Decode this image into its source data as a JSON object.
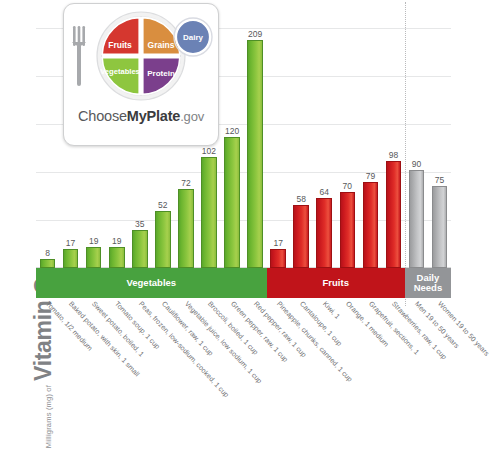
{
  "axis": {
    "y_title_small": "Milligrams (mg) of",
    "y_title_large": "Vitamin C",
    "y_min": 0,
    "y_max": 220,
    "gridlines": [
      0,
      44,
      88,
      132,
      176,
      220
    ]
  },
  "logo": {
    "name": "myplate-logo",
    "wordmark_1": "Choose",
    "wordmark_2": "MyPlate",
    "wordmark_3": ".gov",
    "segments": [
      {
        "label": "Fruits",
        "color": "#d5372f"
      },
      {
        "label": "Grains",
        "color": "#d98e3f"
      },
      {
        "label": "Vegetables",
        "color": "#8ec63f"
      },
      {
        "label": "Protein",
        "color": "#7b3f8c"
      },
      {
        "label": "Dairy",
        "color": "#6b82b5"
      }
    ]
  },
  "bands": [
    {
      "label": "Vegetables",
      "color": "#48a23f",
      "count": 10
    },
    {
      "label": "Fruits",
      "color": "#c0141a",
      "count": 6
    },
    {
      "label": "Daily Needs",
      "color": "#939598",
      "count": 2
    }
  ],
  "chart_data": {
    "type": "bar",
    "title": "Vitamin C",
    "xlabel": "",
    "ylabel": "Milligrams (mg) of Vitamin C",
    "ylim": [
      0,
      220
    ],
    "grid": true,
    "legend": "none",
    "categories": [
      "Tomato, 1/2 medium",
      "Baked potato, with skin, 1 small",
      "Sweet potato, boiled, 1",
      "Tomato soup, 1 cup",
      "Peas, frozen, low-sodium, cooked, 1 cup",
      "Cauliflower, raw, 1 cup",
      "Vegetable juice, low sodium, 1 cup",
      "Broccoli, boiled, 1 cup",
      "Green pepper, raw, 1 cup",
      "Red pepper, raw, 1 cup",
      "Pineapple, chunks, canned, 1 cup",
      "Cantaloupe, 1 cup",
      "Kiwi, 1",
      "Orange, 1 medium",
      "Grapefruit, sections, 1",
      "Strawberries, raw, 1 cup",
      "Men 19 to 50 years",
      "Women 19 to 50 years"
    ],
    "values": [
      8,
      17,
      19,
      19,
      35,
      52,
      72,
      102,
      120,
      209,
      17,
      58,
      64,
      70,
      79,
      98,
      90,
      75
    ],
    "groups": [
      "Vegetables",
      "Vegetables",
      "Vegetables",
      "Vegetables",
      "Vegetables",
      "Vegetables",
      "Vegetables",
      "Vegetables",
      "Vegetables",
      "Vegetables",
      "Fruits",
      "Fruits",
      "Fruits",
      "Fruits",
      "Fruits",
      "Fruits",
      "Daily Needs",
      "Daily Needs"
    ],
    "colors": {
      "Vegetables": "#8cc63f",
      "Fruits": "#d8232a",
      "Daily Needs": "#bcbdbf"
    }
  }
}
